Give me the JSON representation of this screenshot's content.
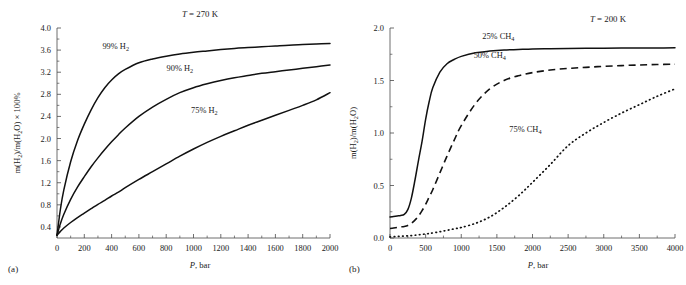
{
  "figure": {
    "panels": [
      {
        "tag": "(a)",
        "title": "T = 270 K",
        "title_italic_prefix": "T",
        "title_rest": " = 270 K",
        "ylabel_parts": [
          "m(H",
          "2",
          ")/m(H",
          "2",
          "O) × 100%"
        ],
        "xlabel_italic": "P",
        "xlabel_rest": ", bar",
        "series_labels": [
          "99% H2",
          "90% H2",
          "75% H2"
        ]
      },
      {
        "tag": "(b)",
        "title": "T = 200 K",
        "title_italic_prefix": "T",
        "title_rest": " = 200 K",
        "ylabel_parts": [
          "m(H",
          "2",
          ")/m(H",
          "2",
          "O)"
        ],
        "xlabel_italic": "P",
        "xlabel_rest": ", bar",
        "series_labels": [
          "25% CH4",
          "50% CH4",
          "75% CH4"
        ]
      }
    ]
  },
  "chart_data": [
    {
      "type": "line",
      "panel": "a",
      "panel_tag": "(a)",
      "title": "T = 270 K",
      "xlabel": "P, bar",
      "ylabel": "m(H2)/m(H2O) × 100%",
      "xlim": [
        0,
        2000
      ],
      "ylim": [
        0.2,
        4.0
      ],
      "xticks": [
        0,
        200,
        400,
        600,
        800,
        1000,
        1200,
        1400,
        1600,
        1800,
        2000
      ],
      "xtick_labels": [
        "0",
        "200",
        "400",
        "600",
        "800",
        "1000",
        "1200",
        "1400",
        "1600",
        "1800",
        "2000"
      ],
      "xminor_step": 100,
      "yticks": [
        0.4,
        0.8,
        1.2,
        1.6,
        2.0,
        2.4,
        2.8,
        3.2,
        3.6,
        4.0
      ],
      "ytick_labels": [
        "0.4",
        "0.8",
        "1.2",
        "1.6",
        "2.0",
        "2.4",
        "2.8",
        "3.2",
        "3.6",
        "4.0"
      ],
      "grid": false,
      "legend": "inline-curve-labels",
      "x": [
        0,
        25,
        50,
        100,
        150,
        200,
        250,
        300,
        350,
        400,
        450,
        500,
        600,
        700,
        800,
        900,
        1000,
        1100,
        1200,
        1300,
        1400,
        1500,
        1600,
        1700,
        1800,
        1900,
        2000
      ],
      "series": [
        {
          "name": "99% H2",
          "style": "solid",
          "label_x": 430,
          "label_y": 3.62,
          "values": [
            0.25,
            0.72,
            1.07,
            1.58,
            1.96,
            2.26,
            2.52,
            2.74,
            2.92,
            3.06,
            3.17,
            3.25,
            3.37,
            3.44,
            3.49,
            3.53,
            3.56,
            3.585,
            3.61,
            3.63,
            3.645,
            3.66,
            3.675,
            3.69,
            3.7,
            3.71,
            3.72
          ]
        },
        {
          "name": "90% H2",
          "style": "solid",
          "label_x": 900,
          "label_y": 3.22,
          "values": [
            0.25,
            0.46,
            0.63,
            0.9,
            1.12,
            1.31,
            1.49,
            1.65,
            1.8,
            1.94,
            2.07,
            2.19,
            2.4,
            2.57,
            2.71,
            2.83,
            2.92,
            2.99,
            3.05,
            3.1,
            3.14,
            3.18,
            3.21,
            3.24,
            3.27,
            3.3,
            3.33
          ]
        },
        {
          "name": "75% H2",
          "style": "solid",
          "label_x": 1080,
          "label_y": 2.46,
          "values": [
            0.25,
            0.32,
            0.38,
            0.48,
            0.57,
            0.65,
            0.73,
            0.81,
            0.88,
            0.96,
            1.03,
            1.11,
            1.26,
            1.4,
            1.54,
            1.68,
            1.81,
            1.93,
            2.04,
            2.14,
            2.24,
            2.33,
            2.42,
            2.51,
            2.6,
            2.7,
            2.83
          ]
        }
      ]
    },
    {
      "type": "line",
      "panel": "b",
      "panel_tag": "(b)",
      "title": "T = 200 K",
      "xlabel": "P, bar",
      "ylabel": "m(H2)/m(H2O)",
      "xlim": [
        0,
        4000
      ],
      "ylim": [
        0.0,
        2.0
      ],
      "xticks": [
        0,
        500,
        1000,
        1500,
        2000,
        2500,
        3000,
        3500,
        4000
      ],
      "xtick_labels": [
        "0",
        "500",
        "1000",
        "1500",
        "2000",
        "2500",
        "3000",
        "3500",
        "4000"
      ],
      "xminor_step": 250,
      "yticks": [
        0.0,
        0.5,
        1.0,
        1.5,
        2.0
      ],
      "ytick_labels": [
        "0.0",
        "0.5",
        "1.0",
        "1.5",
        "2.0"
      ],
      "grid": false,
      "legend": "inline-curve-labels",
      "x": [
        0,
        50,
        100,
        150,
        200,
        250,
        300,
        350,
        400,
        450,
        500,
        550,
        600,
        700,
        800,
        900,
        1000,
        1200,
        1400,
        1600,
        1800,
        2000,
        2250,
        2500,
        2750,
        3000,
        3250,
        3500,
        3750,
        4000
      ],
      "series": [
        {
          "name": "25% CH4",
          "style": "solid",
          "label_x": 1520,
          "label_y": 1.9,
          "values": [
            0.2,
            0.205,
            0.21,
            0.215,
            0.225,
            0.27,
            0.38,
            0.55,
            0.74,
            0.92,
            1.13,
            1.3,
            1.43,
            1.58,
            1.66,
            1.7,
            1.73,
            1.765,
            1.78,
            1.79,
            1.795,
            1.8,
            1.802,
            1.804,
            1.806,
            1.808,
            1.809,
            1.81,
            1.81,
            1.811
          ]
        },
        {
          "name": "50% CH4",
          "style": "dashed",
          "label_x": 1400,
          "label_y": 1.71,
          "values": [
            0.09,
            0.095,
            0.1,
            0.105,
            0.11,
            0.12,
            0.14,
            0.17,
            0.21,
            0.26,
            0.32,
            0.39,
            0.46,
            0.62,
            0.78,
            0.93,
            1.07,
            1.28,
            1.42,
            1.5,
            1.545,
            1.575,
            1.6,
            1.615,
            1.625,
            1.635,
            1.642,
            1.648,
            1.652,
            1.655
          ]
        },
        {
          "name": "75% CH4",
          "style": "dotted",
          "label_x": 1900,
          "label_y": 1.01,
          "values": [
            0.01,
            0.012,
            0.014,
            0.016,
            0.018,
            0.02,
            0.023,
            0.026,
            0.03,
            0.034,
            0.038,
            0.043,
            0.048,
            0.06,
            0.073,
            0.087,
            0.1,
            0.14,
            0.2,
            0.29,
            0.4,
            0.53,
            0.7,
            0.88,
            1.0,
            1.1,
            1.19,
            1.27,
            1.35,
            1.42
          ]
        }
      ]
    }
  ]
}
